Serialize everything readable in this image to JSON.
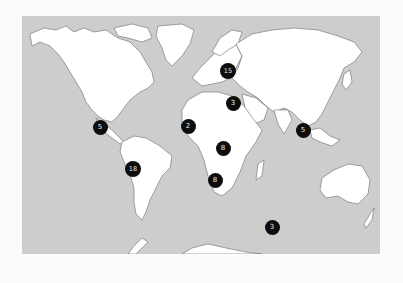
{
  "map": {
    "title": "",
    "ocean_color": "#cdcdcd",
    "land_color": "#ffffff",
    "marker_color": "#0d0d0d",
    "marker_text_color": "#e8e8e8",
    "markers": [
      {
        "region": "Central America / Caribbean",
        "count": "5"
      },
      {
        "region": "South America (Brazil)",
        "count": "18"
      },
      {
        "region": "West Africa",
        "count": "2"
      },
      {
        "region": "East Africa",
        "count": "8"
      },
      {
        "region": "Southern Africa",
        "count": "8"
      },
      {
        "region": "Eastern Europe / Russia",
        "count": "15"
      },
      {
        "region": "Middle East",
        "count": "3"
      },
      {
        "region": "Southeast Asia",
        "count": "5"
      },
      {
        "region": "Southern Indian Ocean",
        "count": "3"
      }
    ]
  }
}
